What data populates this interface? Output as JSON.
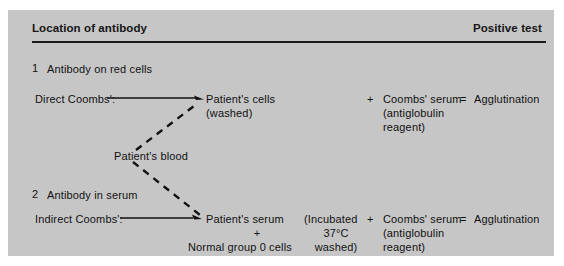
{
  "figure": {
    "header": {
      "left_label": "Location of antibody",
      "right_label": "Positive test"
    },
    "sections": [
      {
        "number": "1",
        "title": "Antibody on red cells",
        "test_name": "Direct Coombs':",
        "sample": "Patient's cells",
        "sample_note": "(washed)",
        "plus": "+",
        "reagent": "Coombs' serum",
        "reagent_note_1": "(antiglobulin",
        "reagent_note_2": "reagent)",
        "equals": "=",
        "result": "Agglutination"
      },
      {
        "number": "2",
        "title": "Antibody in serum",
        "test_name": "Indirect Coombs':",
        "sample": "Patient's serum",
        "sample_plus": "+",
        "sample_add": "Normal group 0 cells",
        "condition_1": "(Incubated",
        "condition_2": "37°C",
        "condition_3": "washed)",
        "plus": "+",
        "reagent": "Coombs' serum",
        "reagent_note_1": "(antiglobulin",
        "reagent_note_2": "reagent)",
        "equals": "=",
        "result": "Agglutination"
      }
    ],
    "source": {
      "label": "Patient's blood"
    },
    "colors": {
      "panel_background": "#c6c6c6",
      "page_background": "#ffffff",
      "ink": "#111111",
      "rule": "#1a1a1a"
    }
  }
}
